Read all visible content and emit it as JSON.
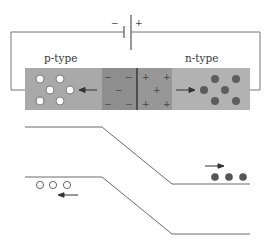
{
  "diagram": {
    "battery": {
      "negative_label": "−",
      "positive_label": "+"
    },
    "regions": {
      "p_type": {
        "label": "p-type",
        "color": "#a8a8a8",
        "carriers": "holes",
        "carrier_count": 6
      },
      "depletion_p": {
        "color": "#8f8f8f",
        "charges": [
          "−",
          "−",
          "−",
          "−",
          "−"
        ]
      },
      "depletion_n": {
        "color": "#999999",
        "charges": [
          "+",
          "+",
          "+",
          "+",
          "+"
        ]
      },
      "n_type": {
        "label": "n-type",
        "color": "#b0b0b0",
        "carriers": "electrons",
        "carrier_count": 6
      }
    },
    "band_diagram": {
      "conduction_band": {
        "left_level": "high",
        "right_level": "low"
      },
      "valence_band": {
        "left_level": "high",
        "right_level": "low"
      },
      "holes_shown": 3,
      "electrons_shown": 3,
      "hole_arrow_direction": "left",
      "electron_arrow_direction": "right"
    },
    "colors": {
      "wire": "#777777",
      "hole_fill": "#ffffff",
      "electron_fill": "#5a5a5a",
      "band_line": "#6a6a6a",
      "arrow": "#333333"
    }
  }
}
